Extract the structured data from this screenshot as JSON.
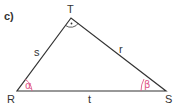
{
  "part_label": "c)",
  "vertices": {
    "T": {
      "label": "T",
      "x": 71,
      "y": 18
    },
    "R": {
      "label": "R",
      "x": 17,
      "y": 91
    },
    "S": {
      "label": "S",
      "x": 166,
      "y": 91
    }
  },
  "sides": {
    "s": {
      "label": "s"
    },
    "r": {
      "label": "r"
    },
    "t": {
      "label": "t"
    }
  },
  "angles": {
    "alpha": {
      "label": "α",
      "vertex": "R"
    },
    "beta": {
      "label": "β",
      "vertex": "S"
    },
    "right": {
      "vertex": "T",
      "marker": "·"
    }
  },
  "colors": {
    "line": "#333333",
    "angle": "#e0588a"
  }
}
